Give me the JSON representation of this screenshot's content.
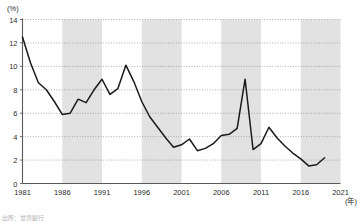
{
  "chart_data": {
    "type": "line",
    "title": "",
    "subtitle": "",
    "xlabel": "(年)",
    "ylabel": "(%)",
    "xlim": [
      1981,
      2021
    ],
    "ylim": [
      0,
      14
    ],
    "grid": "horizontal-dotted",
    "legend": "none",
    "line_color": "#1a1a1a",
    "band_color": "#e2e2e2",
    "y_ticks": [
      0,
      2,
      4,
      6,
      8,
      10,
      12,
      14
    ],
    "y_tick_labels": [
      "0",
      "2",
      "4",
      "6",
      "8",
      "10",
      "12",
      "14"
    ],
    "x_ticks": [
      1981,
      1986,
      1991,
      1996,
      2001,
      2006,
      2011,
      2016,
      2021
    ],
    "x_tick_labels": [
      "1981",
      "1986",
      "1991",
      "1996",
      "2001",
      "2006",
      "2011",
      "2016",
      "2021"
    ],
    "shaded_bands": [
      {
        "start": 1986,
        "end": 1991
      },
      {
        "start": 1996,
        "end": 2001
      },
      {
        "start": 2006,
        "end": 2011
      },
      {
        "start": 2016,
        "end": 2021
      }
    ],
    "series": [
      {
        "name": "rate",
        "x": [
          1981,
          1982,
          1983,
          1984,
          1985,
          1986,
          1987,
          1988,
          1989,
          1990,
          1991,
          1992,
          1993,
          1994,
          1995,
          1996,
          1997,
          1998,
          1999,
          2000,
          2001,
          2002,
          2003,
          2004,
          2005,
          2006,
          2007,
          2008,
          2009,
          2010,
          2011,
          2012,
          2013,
          2014,
          2015,
          2016,
          2017,
          2018,
          2019
        ],
        "values": [
          12.5,
          10.3,
          8.6,
          8.0,
          7.0,
          5.9,
          6.0,
          7.2,
          6.9,
          8.0,
          8.9,
          7.6,
          8.1,
          10.1,
          8.7,
          7.0,
          5.7,
          4.8,
          3.9,
          3.1,
          3.3,
          3.8,
          2.8,
          3.0,
          3.4,
          4.1,
          4.2,
          4.7,
          8.9,
          2.9,
          3.4,
          4.8,
          3.9,
          3.2,
          2.6,
          2.1,
          1.5,
          1.6,
          2.2
        ],
        "values_note": "annual percent values read from axis"
      }
    ]
  },
  "labels": {
    "y_unit": "(%)",
    "x_unit": "(年)",
    "source_note": "出所：世界銀行"
  }
}
